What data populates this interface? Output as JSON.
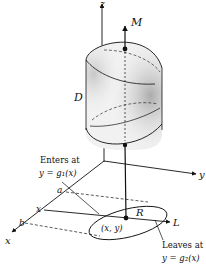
{
  "figure": {
    "type": "3D region diagram",
    "axes": {
      "x": "x",
      "y": "y",
      "z": "z"
    },
    "solid_label": "D",
    "region_label": "R",
    "exit_point_label": "M",
    "point_label": "(x, y)",
    "line_label": "L",
    "x_axis_ticks": {
      "a": "a",
      "x": "x",
      "b": "b"
    },
    "enters": {
      "line1": "Enters at",
      "line2": "y = g₁(x)"
    },
    "leaves": {
      "line1": "Leaves at",
      "line2": "y = g₂(x)"
    }
  },
  "colors": {
    "ink": "#111111",
    "shade": "#cfcfcf",
    "background": "#ffffff"
  }
}
